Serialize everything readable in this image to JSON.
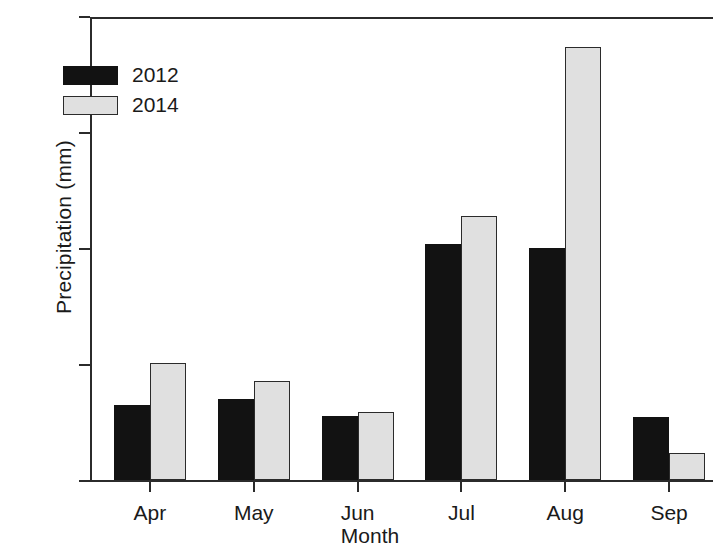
{
  "chart_data": {
    "type": "bar",
    "title": "",
    "xlabel": "Month",
    "ylabel": "Precipitation (mm)",
    "categories": [
      "Apr",
      "May",
      "Jun",
      "Jul",
      "Aug",
      "Sep"
    ],
    "series": [
      {
        "name": "2012",
        "color": "#121212",
        "values": [
          13.0,
          14.0,
          11.0,
          40.7,
          40.0,
          10.8
        ]
      },
      {
        "name": "2014",
        "color": "#e0e0e0",
        "values": [
          20.1,
          17.0,
          11.7,
          45.5,
          74.7,
          4.6
        ]
      }
    ],
    "ylim": [
      0,
      80
    ],
    "yticks": [
      0,
      20,
      40,
      60,
      80
    ],
    "ytick_labels": [
      "0",
      "20",
      "40",
      "60",
      "80"
    ],
    "grid": false,
    "legend_position": "top-left-inside",
    "legend_entries": [
      "2012",
      "2014"
    ]
  },
  "axes": {
    "y_label": "Precipitation (mm)",
    "x_label": "Month"
  }
}
